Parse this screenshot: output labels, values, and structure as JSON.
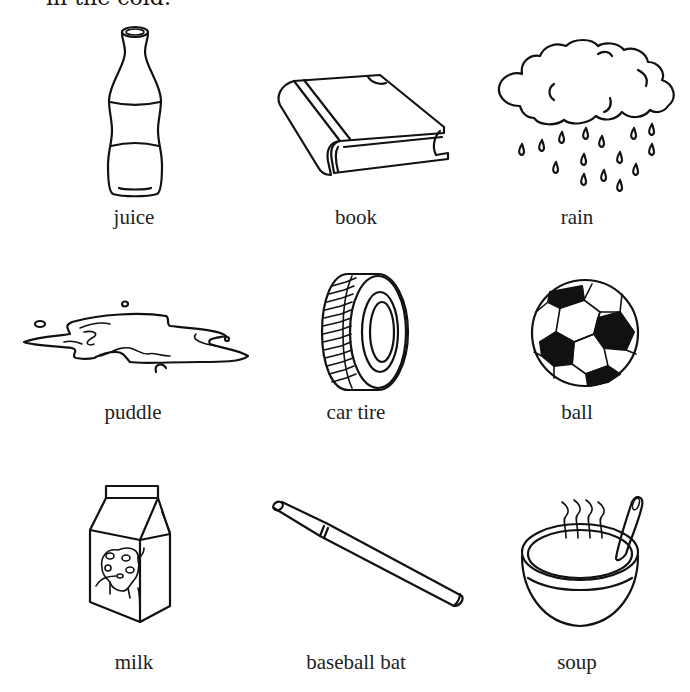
{
  "header": {
    "instruction_fragment": "in the cold."
  },
  "items": [
    {
      "label": "juice",
      "icon": "juice-bottle-icon"
    },
    {
      "label": "book",
      "icon": "book-icon"
    },
    {
      "label": "rain",
      "icon": "rain-cloud-icon"
    },
    {
      "label": "puddle",
      "icon": "puddle-icon"
    },
    {
      "label": "car tire",
      "icon": "car-tire-icon"
    },
    {
      "label": "ball",
      "icon": "soccer-ball-icon"
    },
    {
      "label": "milk",
      "icon": "milk-carton-icon"
    },
    {
      "label": "baseball bat",
      "icon": "baseball-bat-icon"
    },
    {
      "label": "soup",
      "icon": "soup-bowl-icon"
    }
  ]
}
